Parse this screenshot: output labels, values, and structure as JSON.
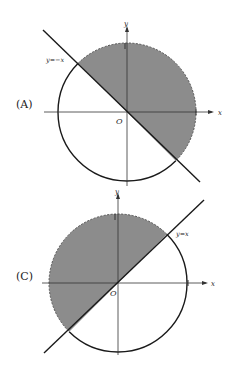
{
  "figure_a": {
    "label": "(A)",
    "line_label": "y=−x",
    "axis_x": "x",
    "axis_y": "y",
    "origin": "O",
    "tick_x": "1",
    "tick_y": "1",
    "shading": "upper-right of y=−x inside circle; boundary arc dashed"
  },
  "figure_c": {
    "label": "(C)",
    "line_label": "y=x",
    "axis_x": "x",
    "axis_y": "y",
    "origin": "O",
    "tick_x": "1",
    "tick_y": "1",
    "shading": "upper-left of y=x inside circle; boundary arc dashed"
  },
  "colors": {
    "shade": "#8c8c8c",
    "line": "#1a1a1a",
    "axis": "#333333"
  }
}
